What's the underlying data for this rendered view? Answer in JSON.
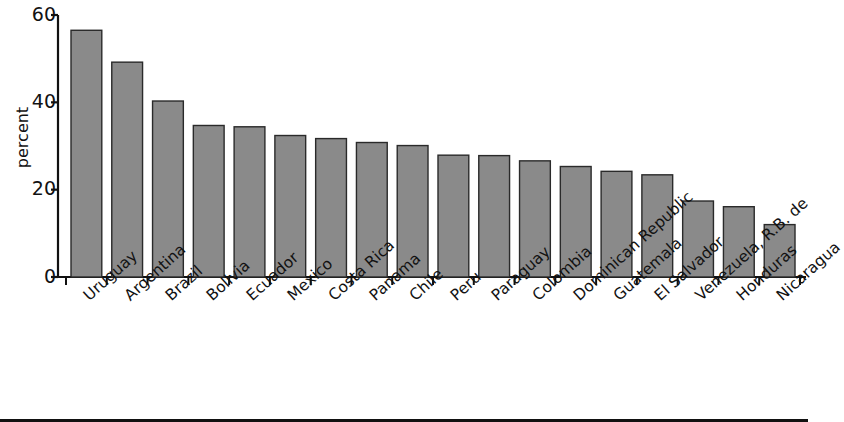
{
  "chart_data": {
    "type": "bar",
    "title": "",
    "subtitle": "",
    "xlabel": "",
    "ylabel": "percent",
    "ylim": [
      0,
      60
    ],
    "yticks": [
      0,
      20,
      40,
      60
    ],
    "ytick_labels": [
      "0",
      "20",
      "40",
      "60"
    ],
    "grid": false,
    "legend": null,
    "bar_color": "#8a8a8a",
    "bar_edge_color": "#2a2a2a",
    "axis_color": "#111111",
    "categories": [
      "Uruguay",
      "Argentina",
      "Brazil",
      "Bolivia",
      "Ecuador",
      "Mexico",
      "Costa Rica",
      "Panama",
      "Chile",
      "Peru",
      "Paraguay",
      "Colombia",
      "Dominican Republic",
      "Guatemala",
      "El Salvador",
      "Venezuela, R.B. de",
      "Honduras",
      "Nicaragua"
    ],
    "values": [
      56.5,
      49.2,
      40.3,
      34.7,
      34.4,
      32.4,
      31.7,
      30.8,
      30.1,
      27.9,
      27.8,
      26.6,
      25.3,
      24.2,
      23.4,
      17.4,
      16.1,
      12.0
    ]
  }
}
